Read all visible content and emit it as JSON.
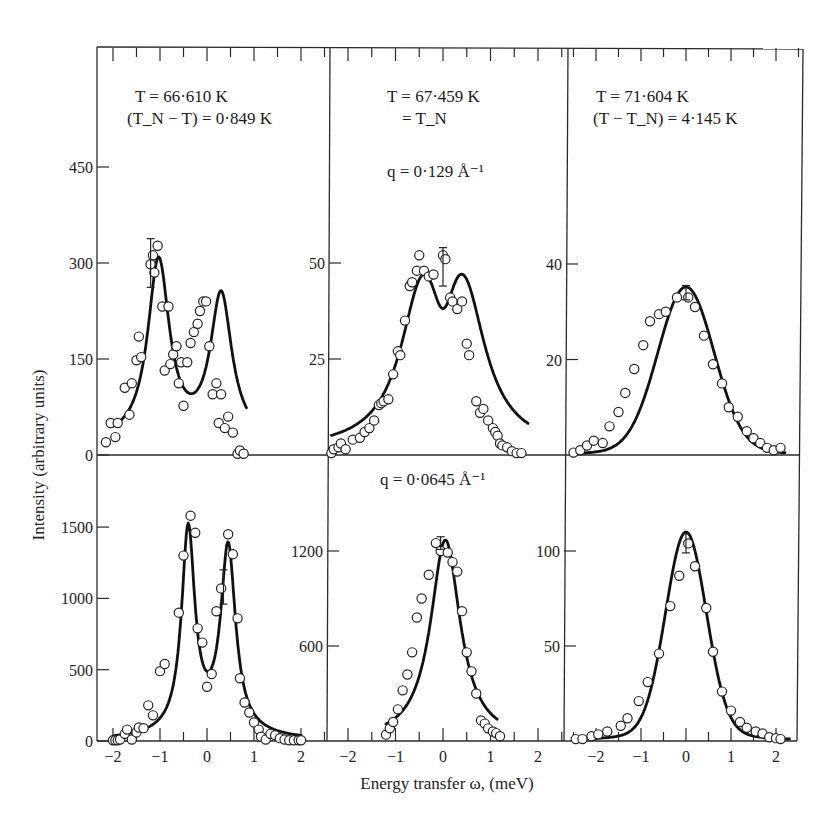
{
  "figure": {
    "y_axis_title": "Intensity (arbitrary units)",
    "x_axis_title": "Energy transfer ω, (meV)",
    "columns": [
      {
        "line1": "T = 66·610 K",
        "line2": "(T_N − T) = 0·849 K"
      },
      {
        "line1": "T = 67·459 K",
        "line2": "= T_N"
      },
      {
        "line1": "T = 71·604 K",
        "line2": "(T − T_N) = 4·145 K"
      }
    ],
    "rows": [
      {
        "q_label": "q = 0·129 Å⁻¹"
      },
      {
        "q_label": "q = 0·0645 Å⁻¹"
      }
    ],
    "x_tick_labels": [
      "−2",
      "−1",
      "0",
      "1",
      "2"
    ],
    "colors": {
      "ink": "#1a1a1a",
      "background": "#ffffff"
    }
  },
  "chart_data": [
    {
      "type": "scatter",
      "panel": "top-left",
      "title": "T = 66·610 K, (T_N − T) = 0·849 K, q = 0·129 Å⁻¹",
      "xlabel": "Energy transfer ω (meV)",
      "ylabel": "Intensity (arbitrary units)",
      "xlim": [
        -2.4,
        2.6
      ],
      "ylim": [
        0,
        450
      ],
      "yticks": [
        0,
        150,
        300,
        450
      ],
      "xticks": [
        -2,
        -1,
        0,
        1,
        2
      ],
      "points": [
        [
          -2.15,
          20
        ],
        [
          -2.05,
          50
        ],
        [
          -1.95,
          28
        ],
        [
          -1.9,
          50
        ],
        [
          -1.75,
          105
        ],
        [
          -1.65,
          63
        ],
        [
          -1.6,
          112
        ],
        [
          -1.5,
          148
        ],
        [
          -1.45,
          185
        ],
        [
          -1.4,
          153
        ],
        [
          -1.2,
          298
        ],
        [
          -1.15,
          312
        ],
        [
          -1.12,
          285
        ],
        [
          -1.05,
          327
        ],
        [
          -0.95,
          232
        ],
        [
          -0.9,
          132
        ],
        [
          -0.82,
          232
        ],
        [
          -0.78,
          142
        ],
        [
          -0.72,
          157
        ],
        [
          -0.65,
          170
        ],
        [
          -0.6,
          112
        ],
        [
          -0.55,
          145
        ],
        [
          -0.5,
          77
        ],
        [
          -0.42,
          145
        ],
        [
          -0.35,
          175
        ],
        [
          -0.28,
          192
        ],
        [
          -0.2,
          205
        ],
        [
          -0.15,
          225
        ],
        [
          -0.08,
          240
        ],
        [
          -0.02,
          240
        ],
        [
          0.05,
          170
        ],
        [
          0.12,
          95
        ],
        [
          0.2,
          112
        ],
        [
          0.25,
          50
        ],
        [
          0.3,
          95
        ],
        [
          0.38,
          42
        ],
        [
          0.45,
          60
        ],
        [
          0.55,
          35
        ],
        [
          0.65,
          2
        ],
        [
          0.7,
          7
        ],
        [
          0.78,
          2
        ]
      ],
      "error_bars": [
        {
          "x": -1.2,
          "y": 300,
          "err": 38
        }
      ],
      "fit_curve": "double peak at ω≈-1.03 (≈305) and ω≈0.3 (≈255), dip ≈95 at ω≈-0.45"
    },
    {
      "type": "scatter",
      "panel": "top-middle",
      "title": "T = 67·459 K = T_N, q = 0·129 Å⁻¹",
      "xlim": [
        -2.4,
        2.5
      ],
      "ylim": [
        0,
        75
      ],
      "yticks": [
        25,
        50
      ],
      "xticks": [
        -2,
        -1,
        0,
        1,
        2
      ],
      "points": [
        [
          -2.35,
          0.5
        ],
        [
          -2.3,
          1.5
        ],
        [
          -2.2,
          2
        ],
        [
          -2.15,
          3
        ],
        [
          -2.05,
          1.5
        ],
        [
          -1.9,
          4
        ],
        [
          -1.75,
          4.5
        ],
        [
          -1.65,
          6
        ],
        [
          -1.55,
          7
        ],
        [
          -1.45,
          9
        ],
        [
          -1.35,
          13
        ],
        [
          -1.3,
          13.5
        ],
        [
          -1.25,
          14
        ],
        [
          -1.15,
          14.5
        ],
        [
          -1.05,
          21
        ],
        [
          -0.95,
          27
        ],
        [
          -0.9,
          26
        ],
        [
          -0.8,
          35
        ],
        [
          -0.7,
          44
        ],
        [
          -0.65,
          45
        ],
        [
          -0.55,
          48
        ],
        [
          -0.5,
          52
        ],
        [
          -0.4,
          48
        ],
        [
          -0.3,
          46.5
        ],
        [
          -0.2,
          47
        ],
        [
          0.0,
          52
        ],
        [
          0.05,
          51
        ],
        [
          0.15,
          41
        ],
        [
          0.2,
          40
        ],
        [
          0.3,
          38
        ],
        [
          0.4,
          40
        ],
        [
          0.5,
          29
        ],
        [
          0.55,
          26
        ],
        [
          0.7,
          14
        ],
        [
          0.78,
          11
        ],
        [
          0.85,
          12
        ],
        [
          0.95,
          9
        ],
        [
          1.05,
          7
        ],
        [
          1.1,
          6
        ],
        [
          1.15,
          5
        ],
        [
          1.2,
          3
        ],
        [
          1.25,
          2.5
        ],
        [
          1.35,
          2
        ],
        [
          1.45,
          1
        ],
        [
          1.55,
          0.5
        ],
        [
          1.65,
          0.5
        ]
      ],
      "error_bars": [
        {
          "x": 0.0,
          "y": 49,
          "err": 5
        }
      ],
      "fit_curve": "broad peak with shallow double maxima ≈49 at ω≈-0.4 and ω≈+0.45"
    },
    {
      "type": "scatter",
      "panel": "top-right",
      "title": "T = 71·604 K, (T − T_N) = 4·145 K, q = 0·129 Å⁻¹",
      "xlim": [
        -2.6,
        2.6
      ],
      "ylim": [
        0,
        60
      ],
      "yticks": [
        20,
        40
      ],
      "xticks": [
        -2,
        -1,
        0,
        1,
        2
      ],
      "points": [
        [
          -2.5,
          0.5
        ],
        [
          -2.35,
          1
        ],
        [
          -2.2,
          2
        ],
        [
          -2.05,
          3
        ],
        [
          -1.85,
          2.5
        ],
        [
          -1.7,
          6
        ],
        [
          -1.5,
          9
        ],
        [
          -1.35,
          13
        ],
        [
          -1.15,
          18
        ],
        [
          -0.95,
          23
        ],
        [
          -0.8,
          28
        ],
        [
          -0.6,
          29.5
        ],
        [
          -0.45,
          30
        ],
        [
          -0.2,
          33
        ],
        [
          0.05,
          33
        ],
        [
          0.2,
          31
        ],
        [
          0.4,
          25
        ],
        [
          0.6,
          19
        ],
        [
          0.8,
          15
        ],
        [
          0.95,
          10
        ],
        [
          1.15,
          8
        ],
        [
          1.35,
          5
        ],
        [
          1.5,
          3.5
        ],
        [
          1.65,
          2.5
        ],
        [
          1.8,
          1.5
        ],
        [
          1.95,
          1
        ],
        [
          2.1,
          1.5
        ]
      ],
      "error_bars": [
        {
          "x": 0.0,
          "y": 34,
          "err": 1.5
        }
      ],
      "fit_curve": "single peak ≈34 at ω≈0, half-width ≈0.9 meV"
    },
    {
      "type": "scatter",
      "panel": "bottom-left",
      "title": "T = 66·610 K, q = 0·0645 Å⁻¹",
      "xlim": [
        -2.4,
        2.6
      ],
      "ylim": [
        0,
        1800
      ],
      "yticks": [
        0,
        500,
        1000,
        1500
      ],
      "xticks": [
        -2,
        -1,
        0,
        1,
        2
      ],
      "points": [
        [
          -2.0,
          5
        ],
        [
          -1.95,
          5
        ],
        [
          -1.9,
          5
        ],
        [
          -1.85,
          10
        ],
        [
          -1.75,
          50
        ],
        [
          -1.7,
          80
        ],
        [
          -1.6,
          10
        ],
        [
          -1.5,
          60
        ],
        [
          -1.45,
          95
        ],
        [
          -1.35,
          90
        ],
        [
          -1.25,
          250
        ],
        [
          -1.15,
          180
        ],
        [
          -1.0,
          490
        ],
        [
          -0.9,
          540
        ],
        [
          -0.6,
          900
        ],
        [
          -0.5,
          1300
        ],
        [
          -0.35,
          1580
        ],
        [
          -0.25,
          1460
        ],
        [
          -0.2,
          790
        ],
        [
          -0.1,
          690
        ],
        [
          0.0,
          380
        ],
        [
          0.1,
          470
        ],
        [
          0.2,
          910
        ],
        [
          0.3,
          1070
        ],
        [
          0.45,
          1450
        ],
        [
          0.55,
          1310
        ],
        [
          0.65,
          860
        ],
        [
          0.7,
          440
        ],
        [
          0.8,
          270
        ],
        [
          0.9,
          200
        ],
        [
          1.0,
          130
        ],
        [
          1.1,
          80
        ],
        [
          1.15,
          30
        ],
        [
          1.25,
          10
        ],
        [
          1.35,
          50
        ],
        [
          1.45,
          40
        ],
        [
          1.55,
          20
        ],
        [
          1.65,
          10
        ],
        [
          1.75,
          5
        ],
        [
          1.85,
          5
        ],
        [
          1.95,
          5
        ],
        [
          2.0,
          5
        ]
      ],
      "error_bars": [
        {
          "x": 0.35,
          "y": 1080,
          "err": 120
        }
      ],
      "fit_curve": "double peak ≈1590 at ω≈-0.4 and ≈1450 at ω≈+0.45, dip ≈530 at ω≈0"
    },
    {
      "type": "scatter",
      "panel": "bottom-middle",
      "title": "T = 67·459 K, q = 0·0645 Å⁻¹",
      "xlim": [
        -2.4,
        2.5
      ],
      "ylim": [
        0,
        1800
      ],
      "yticks": [
        600,
        1200
      ],
      "xticks": [
        -2,
        -1,
        0,
        1,
        2
      ],
      "points": [
        [
          -1.2,
          40
        ],
        [
          -1.12,
          80
        ],
        [
          -1.05,
          120
        ],
        [
          -0.95,
          200
        ],
        [
          -0.85,
          320
        ],
        [
          -0.75,
          420
        ],
        [
          -0.65,
          560
        ],
        [
          -0.55,
          780
        ],
        [
          -0.45,
          900
        ],
        [
          -0.3,
          1050
        ],
        [
          -0.15,
          1250
        ],
        [
          -0.05,
          1200
        ],
        [
          0.1,
          1190
        ],
        [
          0.2,
          1130
        ],
        [
          0.3,
          1070
        ],
        [
          0.4,
          820
        ],
        [
          0.5,
          560
        ],
        [
          0.6,
          440
        ],
        [
          0.7,
          300
        ],
        [
          0.8,
          130
        ],
        [
          0.88,
          110
        ],
        [
          0.95,
          80
        ],
        [
          1.05,
          60
        ],
        [
          1.12,
          50
        ],
        [
          1.2,
          30
        ]
      ],
      "error_bars": [
        {
          "x": -0.05,
          "y": 1250,
          "err": 40
        }
      ],
      "fit_curve": "single peak ≈1270 at ω≈0"
    },
    {
      "type": "scatter",
      "panel": "bottom-right",
      "title": "T = 71·604 K, q = 0·0645 Å⁻¹",
      "xlim": [
        -2.6,
        2.6
      ],
      "ylim": [
        0,
        150
      ],
      "yticks": [
        50,
        100
      ],
      "xticks": [
        -2,
        -1,
        0,
        1,
        2
      ],
      "points": [
        [
          -2.45,
          1
        ],
        [
          -2.3,
          1
        ],
        [
          -2.1,
          2.5
        ],
        [
          -1.95,
          3.5
        ],
        [
          -1.75,
          5
        ],
        [
          -1.45,
          8
        ],
        [
          -1.3,
          12
        ],
        [
          -1.05,
          21
        ],
        [
          -0.85,
          31
        ],
        [
          -0.6,
          46
        ],
        [
          -0.35,
          71
        ],
        [
          -0.15,
          87
        ],
        [
          0.05,
          104
        ],
        [
          0.2,
          92
        ],
        [
          0.45,
          70
        ],
        [
          0.6,
          47
        ],
        [
          0.8,
          26
        ],
        [
          1.0,
          16
        ],
        [
          1.2,
          10
        ],
        [
          1.35,
          7
        ],
        [
          1.55,
          5
        ],
        [
          1.7,
          4
        ],
        [
          1.85,
          2
        ],
        [
          2.0,
          1.5
        ],
        [
          2.1,
          1
        ]
      ],
      "error_bars": [
        {
          "x": 0.0,
          "y": 104,
          "err": 5
        }
      ],
      "fit_curve": "single peak ≈108 at ω≈0"
    }
  ]
}
